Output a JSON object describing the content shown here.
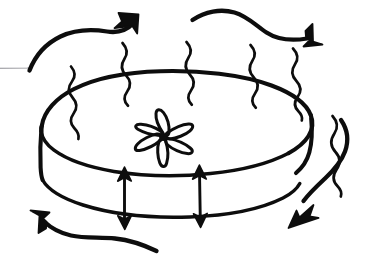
{
  "figure": {
    "title": "Hand-drawn sketch of evaporation from a cylindrical disc",
    "caption": "",
    "background_color": "#ffffff",
    "ink_color": "#0d0d0d",
    "leader_line_color": "#8d8d93",
    "width": 378,
    "height": 275
  },
  "elements": {
    "disc": {
      "name": "cylindrical-disc",
      "description": "Flat cylindrical disc drawn in perspective with elliptical top face and visible side wall"
    },
    "disc_top_face": {
      "name": "disc-top-ellipse",
      "description": "Elliptical top surface of the disc"
    },
    "disc_side_wall": {
      "name": "disc-side-wall",
      "description": "Curved front side wall of the cylinder between the two ellipse arcs"
    },
    "disc_bottom_arc": {
      "name": "disc-bottom-arc",
      "description": "Front arc of the lower ellipse forming the base of the cylinder"
    },
    "flower": {
      "name": "flower-marker",
      "description": "Six-petalled flower or star symbol drawn on the top face of the disc",
      "petal_count": 6
    },
    "evaporation_squiggles": {
      "name": "evaporation-squiggles",
      "description": "Vertical S-shaped wavy lines rising from the rim of the disc indicating vapour",
      "count": 6
    },
    "dimension_arrows": {
      "name": "height-dimension-arrows",
      "description": "Two double-headed vertical arrows spanning the side wall of the disc indicating its thickness",
      "count": 2
    }
  },
  "flow_arrows": [
    {
      "name": "airflow-arrow-top-left",
      "label": "",
      "direction": "up-right",
      "position": "top-left"
    },
    {
      "name": "airflow-arrow-top-right",
      "label": "",
      "direction": "right",
      "position": "top-right"
    },
    {
      "name": "airflow-arrow-right",
      "label": "",
      "direction": "down-left",
      "position": "right"
    },
    {
      "name": "airflow-arrow-bottom-left",
      "label": "",
      "direction": "up-left",
      "position": "bottom-left"
    }
  ],
  "annotations": {
    "leader_line": {
      "name": "leader-line-left",
      "label": "",
      "description": "Thin grey horizontal leader line entering from the left edge"
    }
  }
}
